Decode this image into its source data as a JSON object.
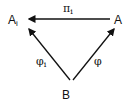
{
  "diagram": {
    "type": "commutative-triangle",
    "nodes": [
      {
        "id": "Ai",
        "label": "A",
        "subscript": "i"
      },
      {
        "id": "A",
        "label": "A"
      },
      {
        "id": "B",
        "label": "B"
      }
    ],
    "edges": [
      {
        "from": "A",
        "to": "Ai",
        "label": "π",
        "subscript": "i"
      },
      {
        "from": "B",
        "to": "Ai",
        "label": "φ",
        "subscript": "i"
      },
      {
        "from": "B",
        "to": "A",
        "label": "φ"
      }
    ],
    "colors": {
      "ink": "#111111",
      "background": "#ffffff"
    }
  }
}
